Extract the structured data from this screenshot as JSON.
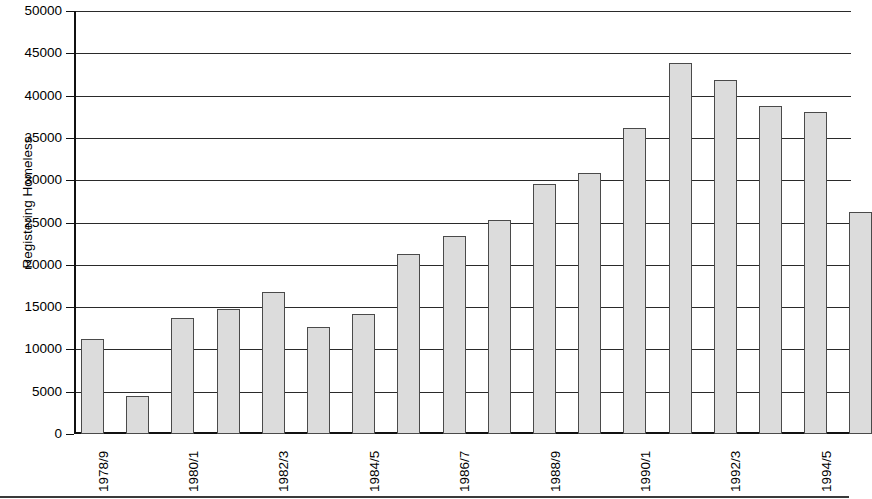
{
  "chart_data": {
    "type": "bar",
    "title": "",
    "xlabel": "",
    "ylabel": "Registering Homeless",
    "ylim": [
      0,
      50000
    ],
    "ytick_interval": 5000,
    "yticks": [
      "0",
      "5000",
      "10000",
      "15000",
      "20000",
      "25000",
      "30000",
      "35000",
      "40000",
      "45000",
      "50000"
    ],
    "grid": true,
    "legend": "none",
    "categories": [
      "1978/9",
      "1979/80",
      "1980/1",
      "1981/2",
      "1982/3",
      "1983/4",
      "1984/5",
      "1985/6",
      "1986/7",
      "1987/8",
      "1988/9",
      "1989/90",
      "1990/1",
      "1991/2",
      "1992/3",
      "1993/4",
      "1994/5"
    ],
    "values": [
      11200,
      4500,
      13700,
      14800,
      16800,
      12700,
      14200,
      21300,
      23400,
      25300,
      29500,
      30900,
      36200,
      43900,
      41800,
      38800,
      38100
    ],
    "visible_xtick_labels": [
      "1978/9",
      "1980/1",
      "1982/3",
      "1984/5",
      "1986/7",
      "1988/9",
      "1990/1",
      "1992/3",
      "1994/5"
    ],
    "last_partial_value": 26200,
    "colors": {
      "bar_fill": "#dcdcdc",
      "bar_border": "#4a4a4a",
      "gridline": "#2a2a2a",
      "axis": "#111111",
      "text": "#000000",
      "background": "#ffffff"
    }
  }
}
